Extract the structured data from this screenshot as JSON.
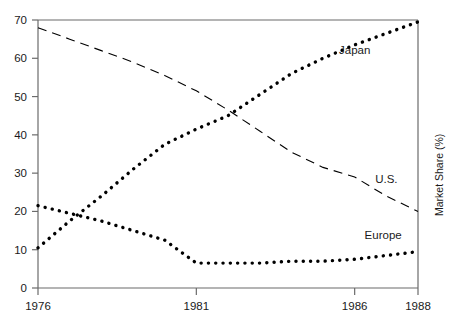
{
  "chart_data": {
    "type": "line",
    "title": "",
    "xlabel": "",
    "ylabel": "Market Share (%)",
    "xlim": [
      1976,
      1988
    ],
    "ylim": [
      0,
      70
    ],
    "xticks": [
      "1976",
      "1981",
      "1986",
      "1988"
    ],
    "xtick_values": [
      1976,
      1981,
      1986,
      1988
    ],
    "yticks": [
      "0",
      "10",
      "20",
      "30",
      "40",
      "50",
      "60",
      "70"
    ],
    "ytick_values": [
      0,
      10,
      20,
      30,
      40,
      50,
      60,
      70
    ],
    "grid": false,
    "legend_position": "inline-annotations",
    "x": [
      1976,
      1977,
      1978,
      1979,
      1980,
      1981,
      1982,
      1983,
      1984,
      1985,
      1986,
      1987,
      1988
    ],
    "series": [
      {
        "name": "Japan",
        "style": "dotted-thick",
        "color": "#000000",
        "values": [
          10.5,
          17.5,
          24.0,
          31.0,
          37.5,
          41.5,
          45.0,
          50.5,
          56.0,
          60.0,
          63.5,
          66.5,
          69.5
        ]
      },
      {
        "name": "U.S.",
        "style": "dashed-thin",
        "color": "#000000",
        "values": [
          68.0,
          65.0,
          62.0,
          59.0,
          55.5,
          51.5,
          46.5,
          41.0,
          35.5,
          31.5,
          29.0,
          24.0,
          20.0
        ]
      },
      {
        "name": "Europe",
        "style": "dotted-thick",
        "color": "#000000",
        "values": [
          21.5,
          19.5,
          17.5,
          15.0,
          12.5,
          6.5,
          6.5,
          6.5,
          7.0,
          7.0,
          7.5,
          8.5,
          9.5
        ]
      }
    ],
    "annotations": [
      {
        "text": "Japan",
        "x": 1986.0,
        "y": 61.0
      },
      {
        "text": "U.S.",
        "x": 1987.0,
        "y": 27.5
      },
      {
        "text": "Europe",
        "x": 1986.9,
        "y": 12.8
      }
    ]
  },
  "axis": {
    "y_title": "Market Share (%)"
  }
}
